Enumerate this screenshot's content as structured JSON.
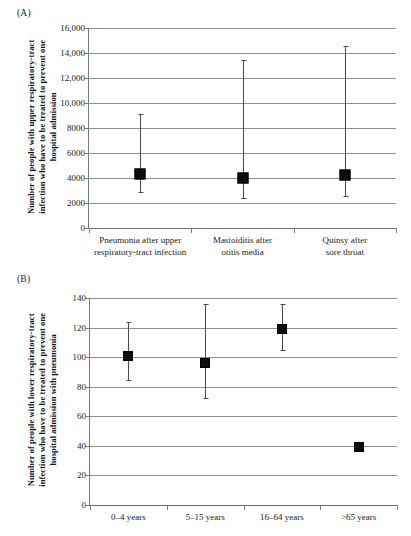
{
  "figure": {
    "panels": [
      {
        "id": "A",
        "label": "(A)",
        "y_axis_title_lines": [
          "Number of people with upper respiratory-tract",
          "infection  who have to be treated to prevent one",
          "hospital admission"
        ],
        "y_ticks": [
          "16,000",
          "14,000",
          "12,000",
          "10,000",
          "8000",
          "6000",
          "4000",
          "2000",
          "0"
        ],
        "categories": [
          {
            "lines": [
              "Pneumonia after upper",
              "respiratory-tract infection"
            ]
          },
          {
            "lines": [
              "Mastoiditis after",
              "otitis media"
            ]
          },
          {
            "lines": [
              "Quinsy after",
              "sore throat"
            ]
          }
        ]
      },
      {
        "id": "B",
        "label": "(B)",
        "y_axis_title_lines": [
          "Number of people with lower respiratory-tract",
          "infection  who have to be treated to prevent one",
          "hospital admission with pneumonia"
        ],
        "y_ticks": [
          "140",
          "120",
          "100",
          "80",
          "60",
          "40",
          "20",
          "0"
        ],
        "categories": [
          {
            "lines": [
              "0–4 years"
            ]
          },
          {
            "lines": [
              "5–15 years"
            ]
          },
          {
            "lines": [
              "16–64 years"
            ]
          },
          {
            "lines": [
              ">65 years"
            ]
          }
        ]
      }
    ]
  },
  "chart_data": [
    {
      "type": "scatter",
      "panel": "A",
      "title": "(A)",
      "xlabel": "",
      "ylabel": "Number of people with upper respiratory-tract infection who have to be treated to prevent one hospital admission",
      "ylim": [
        0,
        16000
      ],
      "ytick_values": [
        0,
        2000,
        4000,
        6000,
        8000,
        10000,
        12000,
        14000,
        16000
      ],
      "ytick_labels": [
        "0",
        "2000",
        "4000",
        "6000",
        "8000",
        "10,000",
        "12,000",
        "14,000",
        "16,000"
      ],
      "grid": true,
      "legend": "none",
      "categories": [
        "Pneumonia after upper respiratory-tract infection",
        "Mastoiditis after otitis media",
        "Quinsy after sore throat"
      ],
      "series": [
        {
          "name": "Number needed to treat",
          "marker": "filled-square",
          "values": [
            4350,
            4000,
            4250
          ],
          "ci_low": [
            2800,
            2350,
            2500
          ],
          "ci_high": [
            9100,
            13450,
            14600
          ]
        }
      ]
    },
    {
      "type": "scatter",
      "panel": "B",
      "title": "(B)",
      "xlabel": "",
      "ylabel": "Number of people with lower respiratory-tract infection who have to be treated to prevent one hospital admission with pneumonia",
      "ylim": [
        0,
        140
      ],
      "ytick_values": [
        0,
        20,
        40,
        60,
        80,
        100,
        120,
        140
      ],
      "ytick_labels": [
        "0",
        "20",
        "40",
        "60",
        "80",
        "100",
        "120",
        "140"
      ],
      "grid": true,
      "legend": "none",
      "categories": [
        "0–4 years",
        "5–15 years",
        "16–64 years",
        ">65 years"
      ],
      "series": [
        {
          "name": "Number needed to treat",
          "marker": "filled-square",
          "values": [
            101,
            96,
            119,
            39
          ],
          "ci_low": [
            84,
            72,
            104,
            36
          ],
          "ci_high": [
            124,
            136,
            136,
            42
          ]
        }
      ]
    }
  ]
}
